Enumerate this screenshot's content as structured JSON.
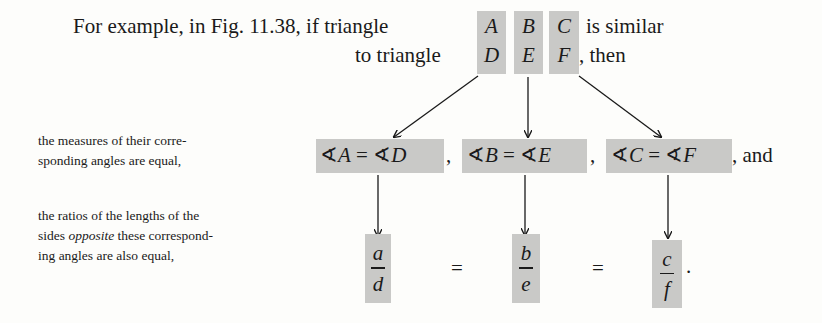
{
  "header": {
    "line1_prefix": "For example, in Fig. 11.38, if triangle",
    "line1_suffix": "is similar",
    "line2_prefix": "to triangle",
    "line2_suffix": ", then",
    "triangle1": [
      "A",
      "B",
      "C"
    ],
    "triangle2": [
      "D",
      "E",
      "F"
    ]
  },
  "row_angles": {
    "label_lines": [
      "the measures of their corre-",
      "sponding angles are equal,"
    ],
    "equations": [
      {
        "left": "A",
        "right": "D"
      },
      {
        "left": "B",
        "right": "E"
      },
      {
        "left": "C",
        "right": "F"
      }
    ],
    "angle_symbol": "∢",
    "equals": "=",
    "separator": ",",
    "trailing": ", and"
  },
  "row_ratios": {
    "label_line1": "the ratios of the lengths of the",
    "label_line2_pre": "sides ",
    "label_line2_em": "opposite",
    "label_line2_post": " these correspond-",
    "label_line3": "ing angles are also equal,",
    "fractions": [
      {
        "num": "a",
        "den": "d"
      },
      {
        "num": "b",
        "den": "e"
      },
      {
        "num": "c",
        "den": "f"
      }
    ],
    "equals": "=",
    "trailing": "."
  },
  "colors": {
    "highlight": "#c9c9c7",
    "ink": "#1a1a1a",
    "paper": "#fdfdfb"
  }
}
